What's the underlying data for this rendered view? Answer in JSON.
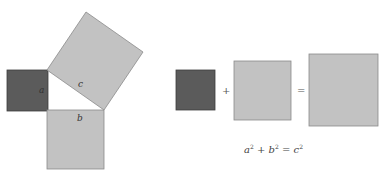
{
  "colors": {
    "dark_square": "#5b5b5b",
    "dark_border": "#3e3e3e",
    "light_square": "#c2c2c2",
    "light_border": "#8a8a8a",
    "background": "#ffffff"
  },
  "left_figure": {
    "square_a_label": "a",
    "square_b_label": "b",
    "square_c_label": "c"
  },
  "right_figure": {
    "plus": "+",
    "equals": "=",
    "equation": {
      "a": "a",
      "b": "b",
      "c": "c",
      "exp": "2",
      "plus": " + ",
      "equals": " = "
    }
  }
}
